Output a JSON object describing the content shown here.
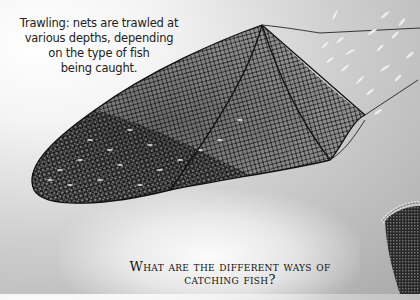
{
  "caption": {
    "lines": [
      "Trawling: nets are trawled at",
      "various depths, depending",
      "on the type of fish",
      "being caught."
    ]
  },
  "heading": {
    "line1": "What are the different ways of",
    "line2": "catching fish?"
  },
  "illustrations": {
    "trawl_net": "trawl-net-illustration",
    "fish_school": "fish-school-illustration",
    "basket_trap": "basket-trap-illustration"
  },
  "colors": {
    "net": "#1a1a1a",
    "background_light": "#ffffff",
    "background_dark": "#a9a9a9",
    "text": "#111111"
  }
}
